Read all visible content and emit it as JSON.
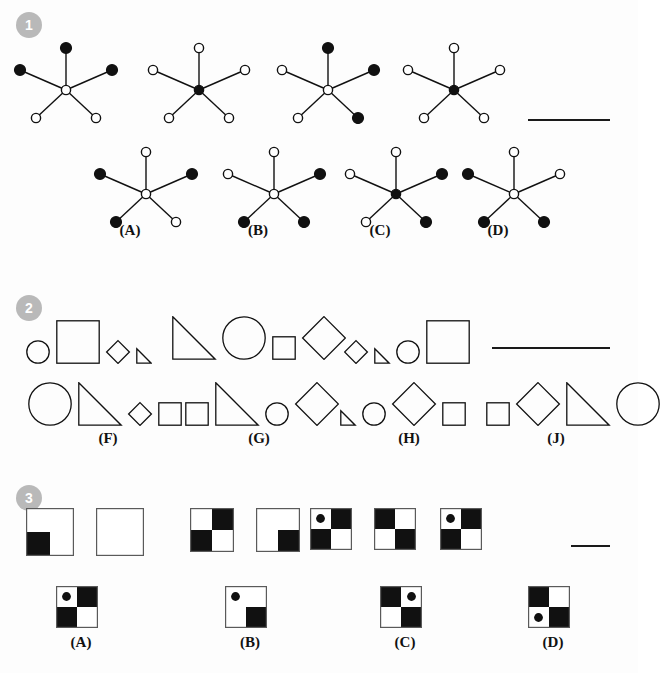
{
  "page": {
    "width": 638,
    "height": 673,
    "background": "#fdfdfd",
    "ink": "#111111",
    "badge_color": "#b9b9b9",
    "badge_text_color": "#ffffff"
  },
  "questions": [
    {
      "number": "1",
      "type": "star-series",
      "badge": {
        "x": 16,
        "y": 12
      },
      "answer_blank": {
        "x": 528,
        "y": 119,
        "width": 82
      },
      "prompt_figures": [
        {
          "name": "star-prompt-1",
          "x": 10,
          "y": 38,
          "center": "open",
          "nodes": [
            {
              "pos": "top",
              "fill": "filled"
            },
            {
              "pos": "left",
              "fill": "filled"
            },
            {
              "pos": "right",
              "fill": "filled"
            },
            {
              "pos": "bottom-left",
              "fill": "open"
            },
            {
              "pos": "bottom-right",
              "fill": "open"
            }
          ]
        },
        {
          "name": "star-prompt-2",
          "x": 143,
          "y": 38,
          "center": "filled",
          "nodes": [
            {
              "pos": "top",
              "fill": "open"
            },
            {
              "pos": "left",
              "fill": "open"
            },
            {
              "pos": "right",
              "fill": "open"
            },
            {
              "pos": "bottom-left",
              "fill": "open"
            },
            {
              "pos": "bottom-right",
              "fill": "open"
            }
          ]
        },
        {
          "name": "star-prompt-3",
          "x": 272,
          "y": 38,
          "center": "open",
          "nodes": [
            {
              "pos": "top",
              "fill": "filled"
            },
            {
              "pos": "left",
              "fill": "open"
            },
            {
              "pos": "right",
              "fill": "filled"
            },
            {
              "pos": "bottom-left",
              "fill": "open"
            },
            {
              "pos": "bottom-right",
              "fill": "filled"
            }
          ]
        },
        {
          "name": "star-prompt-4",
          "x": 398,
          "y": 38,
          "center": "filled",
          "nodes": [
            {
              "pos": "top",
              "fill": "open"
            },
            {
              "pos": "left",
              "fill": "open"
            },
            {
              "pos": "right",
              "fill": "open"
            },
            {
              "pos": "bottom-left",
              "fill": "open"
            },
            {
              "pos": "bottom-right",
              "fill": "open"
            }
          ]
        }
      ],
      "options": [
        {
          "label": "(A)",
          "name": "option-a",
          "x": 90,
          "y": 142,
          "label_x": 107,
          "label_y": 222,
          "center": "open",
          "nodes": [
            {
              "pos": "top",
              "fill": "open"
            },
            {
              "pos": "left",
              "fill": "filled"
            },
            {
              "pos": "right",
              "fill": "filled"
            },
            {
              "pos": "bottom-left",
              "fill": "filled"
            },
            {
              "pos": "bottom-right",
              "fill": "open"
            }
          ]
        },
        {
          "label": "(B)",
          "name": "option-b",
          "x": 218,
          "y": 142,
          "label_x": 235,
          "label_y": 222,
          "center": "open",
          "nodes": [
            {
              "pos": "top",
              "fill": "open"
            },
            {
              "pos": "left",
              "fill": "open"
            },
            {
              "pos": "right",
              "fill": "filled"
            },
            {
              "pos": "bottom-left",
              "fill": "filled"
            },
            {
              "pos": "bottom-right",
              "fill": "filled"
            }
          ]
        },
        {
          "label": "(C)",
          "name": "option-c",
          "x": 340,
          "y": 142,
          "label_x": 357,
          "label_y": 222,
          "center": "filled",
          "nodes": [
            {
              "pos": "top",
              "fill": "open"
            },
            {
              "pos": "left",
              "fill": "open"
            },
            {
              "pos": "right",
              "fill": "filled"
            },
            {
              "pos": "bottom-left",
              "fill": "open"
            },
            {
              "pos": "bottom-right",
              "fill": "filled"
            }
          ]
        },
        {
          "label": "(D)",
          "name": "option-d",
          "x": 458,
          "y": 142,
          "label_x": 475,
          "label_y": 222,
          "center": "open",
          "nodes": [
            {
              "pos": "top",
              "fill": "open"
            },
            {
              "pos": "left",
              "fill": "filled"
            },
            {
              "pos": "right",
              "fill": "open"
            },
            {
              "pos": "bottom-left",
              "fill": "filled"
            },
            {
              "pos": "bottom-right",
              "fill": "filled"
            }
          ]
        }
      ]
    },
    {
      "number": "2",
      "type": "shape-sequence",
      "badge": {
        "x": 16,
        "y": 295
      },
      "answer_blank": {
        "x": 492,
        "y": 347,
        "width": 118
      },
      "prompt_figures": [
        {
          "name": "shapes-prompt-1",
          "x": 26,
          "y": 320,
          "shapes": [
            {
              "shape": "circle",
              "size": "small"
            },
            {
              "shape": "square",
              "size": "large"
            },
            {
              "shape": "diamond",
              "size": "small"
            },
            {
              "shape": "triangle",
              "size": "tiny"
            }
          ]
        },
        {
          "name": "shapes-prompt-2",
          "x": 172,
          "y": 316,
          "shapes": [
            {
              "shape": "triangle",
              "size": "large"
            },
            {
              "shape": "circle",
              "size": "large"
            },
            {
              "shape": "square",
              "size": "small"
            },
            {
              "shape": "diamond",
              "size": "large"
            }
          ]
        },
        {
          "name": "shapes-prompt-3",
          "x": 344,
          "y": 320,
          "shapes": [
            {
              "shape": "diamond",
              "size": "small"
            },
            {
              "shape": "triangle",
              "size": "tiny"
            },
            {
              "shape": "circle",
              "size": "small"
            },
            {
              "shape": "square",
              "size": "large"
            }
          ]
        }
      ],
      "options": [
        {
          "label": "(F)",
          "name": "option-f",
          "x": 28,
          "y": 382,
          "label_x": 85,
          "label_y": 430,
          "shapes": [
            {
              "shape": "circle",
              "size": "large"
            },
            {
              "shape": "triangle",
              "size": "large"
            },
            {
              "shape": "diamond",
              "size": "small"
            },
            {
              "shape": "square",
              "size": "small"
            }
          ]
        },
        {
          "label": "(G)",
          "name": "option-g",
          "x": 185,
          "y": 382,
          "label_x": 236,
          "label_y": 430,
          "shapes": [
            {
              "shape": "square",
              "size": "small"
            },
            {
              "shape": "triangle",
              "size": "large"
            },
            {
              "shape": "circle",
              "size": "small"
            },
            {
              "shape": "diamond",
              "size": "large"
            }
          ]
        },
        {
          "label": "(H)",
          "name": "option-h",
          "x": 340,
          "y": 382,
          "label_x": 386,
          "label_y": 430,
          "shapes": [
            {
              "shape": "triangle",
              "size": "tiny"
            },
            {
              "shape": "circle",
              "size": "small"
            },
            {
              "shape": "diamond",
              "size": "large"
            },
            {
              "shape": "square",
              "size": "small"
            }
          ]
        },
        {
          "label": "(J)",
          "name": "option-j",
          "x": 486,
          "y": 382,
          "label_x": 533,
          "label_y": 430,
          "shapes": [
            {
              "shape": "square",
              "size": "small"
            },
            {
              "shape": "diamond",
              "size": "large"
            },
            {
              "shape": "triangle",
              "size": "large"
            },
            {
              "shape": "circle",
              "size": "large"
            }
          ]
        }
      ]
    },
    {
      "number": "3",
      "type": "quadrant-analogy",
      "badge": {
        "x": 16,
        "y": 485
      },
      "answer_blank": {
        "x": 571,
        "y": 545,
        "width": 39
      },
      "prompt_pairs": [
        {
          "name": "pair-1",
          "x": 26,
          "y": 508,
          "size": 48,
          "first": {
            "tl": "white",
            "tr": "white",
            "bl": "black",
            "br": "white",
            "dot": null
          },
          "second": {
            "tl": "white",
            "tr": "white",
            "bl": "white",
            "br": "white",
            "dot": null
          }
        },
        {
          "name": "pair-2",
          "x": 190,
          "y": 508,
          "size": 44,
          "first": {
            "tl": "white",
            "tr": "black",
            "bl": "black",
            "br": "white",
            "dot": null
          },
          "second": {
            "tl": "white",
            "tr": "white",
            "bl": "white",
            "br": "black",
            "dot": null
          }
        },
        {
          "name": "pair-3",
          "x": 310,
          "y": 508,
          "size": 42,
          "first": {
            "tl": "white",
            "tr": "black",
            "bl": "black",
            "br": "white",
            "dot": "tl"
          },
          "second": {
            "tl": "black",
            "tr": "white",
            "bl": "white",
            "br": "black",
            "dot": null
          }
        },
        {
          "name": "pair-4",
          "x": 440,
          "y": 508,
          "size": 42,
          "first": {
            "tl": "white",
            "tr": "black",
            "bl": "black",
            "br": "white",
            "dot": "tl"
          },
          "second": null
        }
      ],
      "options": [
        {
          "label": "(A)",
          "name": "option-a",
          "x": 56,
          "y": 586,
          "size": 42,
          "cells": {
            "tl": "white",
            "tr": "black",
            "bl": "black",
            "br": "white",
            "dot": "tl"
          },
          "label_x": 58,
          "label_y": 634
        },
        {
          "label": "(B)",
          "name": "option-b",
          "x": 225,
          "y": 586,
          "size": 42,
          "cells": {
            "tl": "white",
            "tr": "white",
            "bl": "white",
            "br": "black",
            "dot": "tl"
          },
          "label_x": 227,
          "label_y": 634
        },
        {
          "label": "(C)",
          "name": "option-c",
          "x": 380,
          "y": 586,
          "size": 42,
          "cells": {
            "tl": "black",
            "tr": "white",
            "bl": "white",
            "br": "black",
            "dot": "tr"
          },
          "label_x": 382,
          "label_y": 634
        },
        {
          "label": "(D)",
          "name": "option-d",
          "x": 528,
          "y": 586,
          "size": 42,
          "cells": {
            "tl": "black",
            "tr": "white",
            "bl": "white",
            "br": "black",
            "dot": "bl"
          },
          "label_x": 530,
          "label_y": 634
        }
      ]
    }
  ]
}
